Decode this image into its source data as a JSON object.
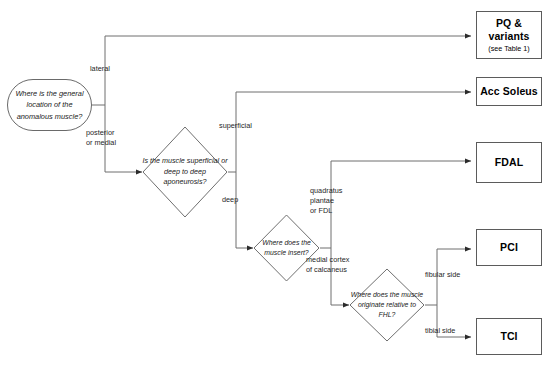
{
  "diagram": {
    "stroke_color": "#5b5b5b",
    "text_color": "#1a1a1a",
    "background": "#ffffff"
  },
  "start": {
    "label": "Where is the general location of the anomalous muscle?"
  },
  "decisions": [
    {
      "id": "aponeurosis",
      "label": "Is the muscle superficial or deep to deep aponeurosis?"
    },
    {
      "id": "insertion",
      "label": "Where does the muscle insert?"
    },
    {
      "id": "origin",
      "label": "Where does the muscle originate relative to FHL?"
    }
  ],
  "results": [
    {
      "id": "pq",
      "label": "PQ & variants",
      "sub": "(see Table 1)"
    },
    {
      "id": "acc-soleus",
      "label": "Acc Soleus",
      "sub": ""
    },
    {
      "id": "fdal",
      "label": "FDAL",
      "sub": ""
    },
    {
      "id": "pci",
      "label": "PCI",
      "sub": ""
    },
    {
      "id": "tci",
      "label": "TCI",
      "sub": ""
    }
  ],
  "edge_labels": [
    {
      "id": "lateral",
      "text": "lateral"
    },
    {
      "id": "posterior-or-medial",
      "text": "posterior\nor medial"
    },
    {
      "id": "superficial",
      "text": "superficial"
    },
    {
      "id": "deep",
      "text": "deep"
    },
    {
      "id": "quadratus-plantae-or-fdl",
      "text": "quadratus\nplantae\nor FDL"
    },
    {
      "id": "medial-cortex-of-calcaneus",
      "text": "medial cortex\nof calcaneus"
    },
    {
      "id": "fibular-side",
      "text": "fibular side"
    },
    {
      "id": "tibial-side",
      "text": "tibial side"
    }
  ]
}
